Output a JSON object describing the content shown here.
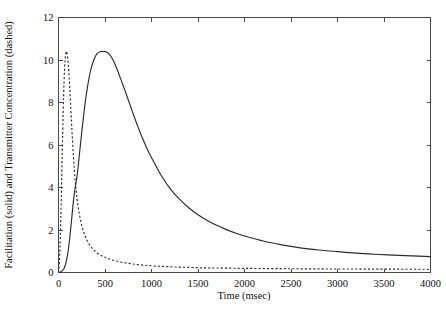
{
  "chart_data": {
    "type": "line",
    "title": "",
    "xlabel": "Time (msec)",
    "ylabel": "Facilitation (solid) and Transmitter Concentration (dashed)",
    "xlim": [
      0,
      4000
    ],
    "ylim": [
      0,
      12
    ],
    "grid": false,
    "legend": "none",
    "xticks": [
      0,
      500,
      1000,
      1500,
      2000,
      2500,
      3000,
      3500,
      4000
    ],
    "xtick_labels": [
      "0",
      "500",
      "1000",
      "1500",
      "2000",
      "2500",
      "3000",
      "3500",
      "4000"
    ],
    "yticks": [
      0,
      2,
      4,
      6,
      8,
      10,
      12
    ],
    "ytick_labels": [
      "0",
      "2",
      "4",
      "6",
      "8",
      "10",
      "12"
    ],
    "series": [
      {
        "name": "Facilitation (solid)",
        "style": "solid",
        "color": "#2b2b2b",
        "peak_x": 500,
        "peak_y": 10.4,
        "x": [
          0,
          20,
          40,
          60,
          80,
          100,
          120,
          140,
          160,
          180,
          200,
          220,
          240,
          260,
          280,
          300,
          320,
          340,
          360,
          380,
          400,
          420,
          440,
          460,
          480,
          500,
          520,
          540,
          560,
          580,
          600,
          640,
          680,
          720,
          760,
          800,
          850,
          900,
          950,
          1000,
          1100,
          1200,
          1300,
          1400,
          1500,
          1600,
          1700,
          1800,
          1900,
          2000,
          2200,
          2400,
          2600,
          2800,
          3000,
          3200,
          3400,
          3600,
          3800,
          4000
        ],
        "y": [
          0.0,
          0.02,
          0.08,
          0.2,
          0.45,
          0.9,
          1.6,
          2.45,
          3.35,
          4.0,
          4.55,
          5.35,
          6.2,
          7.0,
          7.75,
          8.4,
          8.95,
          9.4,
          9.75,
          10.0,
          10.2,
          10.32,
          10.38,
          10.4,
          10.4,
          10.4,
          10.36,
          10.3,
          10.2,
          10.05,
          9.88,
          9.45,
          8.98,
          8.5,
          8.0,
          7.5,
          6.9,
          6.35,
          5.85,
          5.4,
          4.6,
          3.95,
          3.45,
          3.05,
          2.72,
          2.45,
          2.22,
          2.03,
          1.86,
          1.72,
          1.48,
          1.3,
          1.16,
          1.06,
          0.98,
          0.91,
          0.86,
          0.82,
          0.78,
          0.75
        ]
      },
      {
        "name": "Transmitter Concentration (dashed)",
        "style": "dashed",
        "color": "#2b2b2b",
        "peak_x": 85,
        "peak_y": 10.4,
        "x": [
          0,
          10,
          20,
          30,
          40,
          50,
          60,
          70,
          80,
          85,
          90,
          100,
          110,
          120,
          130,
          140,
          150,
          160,
          170,
          180,
          190,
          200,
          215,
          230,
          250,
          270,
          290,
          310,
          340,
          370,
          400,
          440,
          480,
          520,
          570,
          620,
          680,
          740,
          800,
          880,
          960,
          1050,
          1150,
          1250,
          1400,
          1550,
          1700,
          1900,
          2100,
          2400,
          2700,
          3000,
          3400,
          3700,
          4000
        ],
        "y": [
          0.0,
          0.55,
          1.75,
          3.5,
          5.6,
          7.5,
          9.0,
          9.95,
          10.35,
          10.4,
          10.35,
          10.05,
          9.5,
          8.75,
          7.9,
          7.05,
          6.25,
          5.5,
          4.85,
          4.3,
          3.85,
          3.45,
          3.0,
          2.62,
          2.22,
          1.92,
          1.68,
          1.48,
          1.27,
          1.1,
          0.98,
          0.85,
          0.75,
          0.68,
          0.6,
          0.54,
          0.48,
          0.44,
          0.4,
          0.36,
          0.33,
          0.3,
          0.28,
          0.26,
          0.24,
          0.22,
          0.21,
          0.2,
          0.19,
          0.18,
          0.17,
          0.165,
          0.16,
          0.155,
          0.15
        ]
      }
    ]
  }
}
